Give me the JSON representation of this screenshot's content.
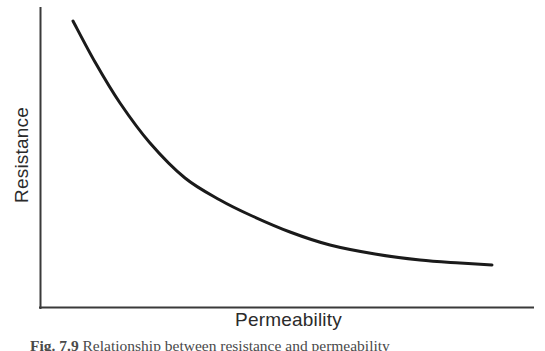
{
  "figure": {
    "kind": "scanned-textbook-figure",
    "background_color": "#ffffff",
    "ink_color": "#1a1a1a",
    "axis_color": "#3a3a3a",
    "label_color": "#2b2b2b"
  },
  "axes": {
    "y_label": "Resistance",
    "x_label": "Permeability",
    "origin_x": 40,
    "origin_y": 308,
    "y_axis_top": 8,
    "x_axis_right": 533,
    "line_width": 2
  },
  "caption": {
    "figure_number": "Fig. 7.9",
    "text": "Relationship between resistance and permeability",
    "cropped": "true"
  },
  "chart_data": {
    "type": "line",
    "title": "",
    "subtitle": "",
    "xlabel": "Permeability",
    "ylabel": "Resistance",
    "grid": "off",
    "legend": "none",
    "axis_ticks": "none",
    "relationship": "inverse",
    "xlim": [
      0,
      100
    ],
    "ylim": [
      0,
      100
    ],
    "series": [
      {
        "name": "Resistance vs Permeability",
        "color": "#1a1a1a",
        "x": [
          7,
          12,
          18,
          24,
          30,
          37,
          45,
          53,
          62,
          71,
          80,
          88,
          92
        ],
        "y": [
          96,
          81,
          67,
          56,
          47,
          39,
          32,
          26,
          21,
          17,
          15,
          14,
          14
        ]
      }
    ],
    "pixel_path": {
      "start": [
        73,
        21
      ],
      "end": [
        492,
        265
      ],
      "samples": [
        [
          73,
          21
        ],
        [
          95,
          62
        ],
        [
          120,
          103
        ],
        [
          150,
          143
        ],
        [
          185,
          178
        ],
        [
          220,
          200
        ],
        [
          250,
          215
        ],
        [
          290,
          232
        ],
        [
          330,
          245
        ],
        [
          375,
          254
        ],
        [
          420,
          260
        ],
        [
          460,
          263
        ],
        [
          492,
          265
        ]
      ]
    }
  }
}
